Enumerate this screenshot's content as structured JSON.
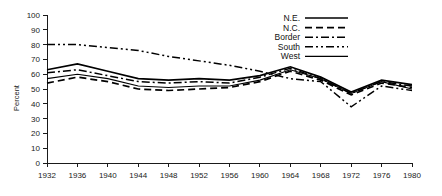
{
  "chart_data": {
    "type": "line",
    "title": "",
    "subtitle": "",
    "xlabel": "",
    "ylabel": "Percent",
    "xlim": [
      1932,
      1980
    ],
    "ylim": [
      0,
      100
    ],
    "grid": false,
    "legend_position": "top-right",
    "x": [
      1932,
      1936,
      1940,
      1944,
      1948,
      1952,
      1956,
      1960,
      1964,
      1968,
      1972,
      1976,
      1980
    ],
    "xtick_labels": [
      "1932",
      "1936",
      "1940",
      "1944",
      "1948",
      "1952",
      "1956",
      "1960",
      "1964",
      "1968",
      "1972",
      "1976",
      "1980"
    ],
    "ytick_labels": [
      "0",
      "10",
      "20",
      "30",
      "40",
      "50",
      "60",
      "70",
      "80",
      "90",
      "100"
    ],
    "ytick_values": [
      0,
      10,
      20,
      30,
      40,
      50,
      60,
      70,
      80,
      90,
      100
    ],
    "series": [
      {
        "name": "N.E.",
        "dash_style": "solid",
        "values": [
          63,
          67,
          62,
          57,
          56,
          57,
          56,
          59,
          65,
          58,
          48,
          56,
          53
        ]
      },
      {
        "name": "N.C.",
        "dash_style": "dashed",
        "values": [
          54,
          58,
          55,
          50,
          49,
          50,
          51,
          55,
          62,
          56,
          46,
          54,
          51
        ]
      },
      {
        "name": "Border",
        "dash_style": "dash-dot",
        "values": [
          61,
          63,
          59,
          55,
          54,
          55,
          54,
          58,
          64,
          57,
          47,
          55,
          52
        ]
      },
      {
        "name": "South",
        "dash_style": "dash-dot-dot",
        "values": [
          80,
          80,
          78,
          76,
          72,
          69,
          66,
          62,
          57,
          55,
          38,
          52,
          49
        ]
      },
      {
        "name": "West",
        "dash_style": "solid-thin",
        "values": [
          57,
          60,
          57,
          52,
          51,
          52,
          52,
          56,
          63,
          57,
          47,
          55,
          50
        ]
      }
    ]
  },
  "legend": {
    "items": [
      {
        "label": "N.E."
      },
      {
        "label": "N.C."
      },
      {
        "label": "Border"
      },
      {
        "label": "South"
      },
      {
        "label": "West"
      }
    ]
  }
}
